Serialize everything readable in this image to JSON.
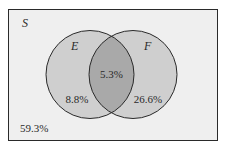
{
  "diagram": {
    "type": "venn",
    "universe": {
      "label": "S",
      "outside_value": "59.3%"
    },
    "sets": [
      {
        "label": "E",
        "only_value": "8.8%"
      },
      {
        "label": "F",
        "only_value": "26.6%"
      }
    ],
    "intersection": {
      "value": "5.3%"
    },
    "colors": {
      "page_background": "#ffffff",
      "universe_fill": "#efefef",
      "set_fill": "#cfcfcf",
      "intersection_fill": "#a9a9a9",
      "stroke": "#2a2a2a"
    }
  }
}
